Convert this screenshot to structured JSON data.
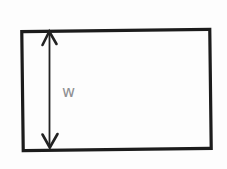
{
  "diagram": {
    "type": "dimensioned-rectangle",
    "width_label": "w",
    "colors": {
      "outline": "#1c1c1c",
      "arrow": "#222222",
      "label": "#8f9093",
      "background": "#fdfdfd"
    }
  }
}
